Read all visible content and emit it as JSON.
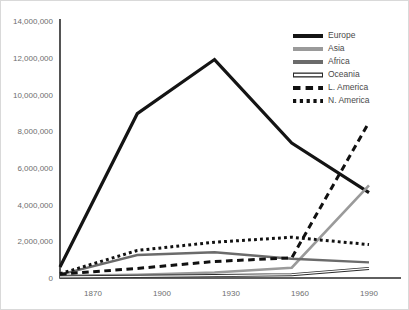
{
  "chart_data": {
    "type": "line",
    "title": "",
    "subtitle": "",
    "xlabel": "",
    "ylabel": "",
    "x": [
      1870,
      1900,
      1930,
      1960,
      1990
    ],
    "categories": [
      "1870",
      "1900",
      "1930",
      "1960",
      "1990"
    ],
    "xlim": [
      1870,
      1990
    ],
    "ylim": [
      0,
      14000000
    ],
    "grid": false,
    "legend_position": "top-right-inside",
    "y_ticks": [
      0,
      2000000,
      4000000,
      6000000,
      8000000,
      10000000,
      12000000,
      14000000
    ],
    "y_tick_labels": [
      "0",
      "2,000,000",
      "4,000,000",
      "6,000,000",
      "8,000,000",
      "10,000,000",
      "12,000,000",
      "14,000,000"
    ],
    "x_tick_labels": [
      "1870",
      "1900",
      "1930",
      "1960",
      "1990"
    ],
    "series": [
      {
        "name": "Europe",
        "values": [
          600000,
          8950000,
          11900000,
          7350000,
          4650000
        ],
        "color": "#141414",
        "style": "solid",
        "width": 3.2
      },
      {
        "name": "Asia",
        "values": [
          120000,
          180000,
          300000,
          560000,
          5050000
        ],
        "color": "#9a9a9a",
        "style": "solid",
        "width": 2.6
      },
      {
        "name": "Africa",
        "values": [
          180000,
          1250000,
          1400000,
          1050000,
          850000
        ],
        "color": "#6b6b6b",
        "style": "solid",
        "width": 2.4
      },
      {
        "name": "Oceania",
        "values": [
          60000,
          90000,
          130000,
          180000,
          520000
        ],
        "color": "#2b2b2b",
        "style": "hollow",
        "width": 1.1
      },
      {
        "name": "L. America",
        "values": [
          210000,
          520000,
          900000,
          1100000,
          8480000
        ],
        "color": "#111111",
        "style": "dashed",
        "width": 3.0
      },
      {
        "name": "N. America",
        "values": [
          230000,
          1500000,
          1950000,
          2220000,
          1820000
        ],
        "color": "#111111",
        "style": "dotted",
        "width": 3.0
      }
    ]
  },
  "legend": {
    "items": [
      {
        "label": "Europe"
      },
      {
        "label": "Asia"
      },
      {
        "label": "Africa"
      },
      {
        "label": "Oceania"
      },
      {
        "label": "L. America"
      },
      {
        "label": "N. America"
      }
    ]
  },
  "axes": {
    "y_labels": [
      "14,000,000",
      "12,000,000",
      "10,000,000",
      "8,000,000",
      "6,000,000",
      "4,000,000",
      "2,000,000",
      "0"
    ],
    "x_labels": [
      "1870",
      "1900",
      "1930",
      "1960",
      "1990"
    ]
  },
  "colors": {
    "axis": "#2b2b2b",
    "tick_text": "#6e6e6e",
    "legend_text": "#4a4a4a",
    "background": "#ffffff",
    "frame": "#d9d9d9"
  }
}
